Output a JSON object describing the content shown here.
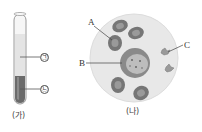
{
  "figure_a": {
    "caption": "(가)",
    "labels": {
      "upper_layer": "㉠",
      "lower_layer": "㉡"
    },
    "colors": {
      "tube_glass": "#f4f4f4",
      "upper_layer": "#e6e6e6",
      "lower_layer": "#6e6e6e"
    }
  },
  "figure_b": {
    "caption": "(나)",
    "labels": {
      "red_blood_cell": "A",
      "white_blood_cell": "B",
      "platelet": "C"
    },
    "colors": {
      "field": "#e8e8e8",
      "red_blood_cell": "#7a7a7a",
      "white_blood_cell": "#8c8c8c",
      "platelet": "#9a9a9a"
    }
  }
}
